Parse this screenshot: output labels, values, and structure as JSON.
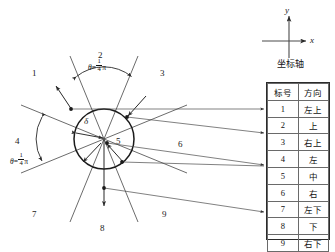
{
  "diagram": {
    "circle_radius_label": "δ",
    "center_region_label": "5",
    "angle_annotations": [
      {
        "id": "angle-top",
        "region": "2",
        "theta": "θ",
        "equals": "=",
        "num": "1",
        "den": "4",
        "pi": "π"
      },
      {
        "id": "angle-left",
        "region": "4",
        "theta": "θ",
        "equals": "=",
        "num": "1",
        "den": "4",
        "pi": "π"
      }
    ],
    "region_numbers": [
      {
        "id": "region-1",
        "label": "1"
      },
      {
        "id": "region-2",
        "label": "2"
      },
      {
        "id": "region-3",
        "label": "3"
      },
      {
        "id": "region-4",
        "label": "4"
      },
      {
        "id": "region-5",
        "label": "5"
      },
      {
        "id": "region-6",
        "label": "6"
      },
      {
        "id": "region-7",
        "label": "7"
      },
      {
        "id": "region-8",
        "label": "8"
      },
      {
        "id": "region-9",
        "label": "9"
      }
    ]
  },
  "axis_legend": {
    "x_label": "x",
    "y_label": "y",
    "caption": "坐标轴"
  },
  "direction_table": {
    "headers": [
      "标号",
      "方向"
    ],
    "rows": [
      {
        "index": "1",
        "direction": "左上"
      },
      {
        "index": "2",
        "direction": "上"
      },
      {
        "index": "3",
        "direction": "右上"
      },
      {
        "index": "4",
        "direction": "左"
      },
      {
        "index": "5",
        "direction": "中"
      },
      {
        "index": "6",
        "direction": "右"
      },
      {
        "index": "7",
        "direction": "左下"
      },
      {
        "index": "8",
        "direction": "下"
      },
      {
        "index": "9",
        "direction": "右下"
      }
    ]
  },
  "colors": {
    "line": "#2b2b2b",
    "thin_line": "#555555",
    "text": "#111111",
    "background": "#ffffff"
  }
}
